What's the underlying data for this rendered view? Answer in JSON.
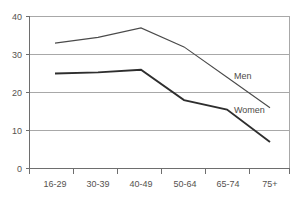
{
  "chart_data": {
    "type": "line",
    "title": "",
    "subtitle": "",
    "xlabel": "",
    "ylabel": "",
    "categories": [
      "16-29",
      "30-39",
      "40-49",
      "50-64",
      "65-74",
      "75+"
    ],
    "series": [
      {
        "name": "Men",
        "values": [
          33,
          34.5,
          37,
          32,
          24,
          16
        ]
      },
      {
        "name": "Women",
        "values": [
          25,
          25.3,
          26,
          18,
          15.5,
          7
        ]
      }
    ],
    "ylim": [
      0,
      40
    ],
    "yticks": [
      0,
      10,
      20,
      30,
      40
    ],
    "ytick_labels": [
      "0",
      "10",
      "20",
      "30",
      "40"
    ],
    "grid": "horizontal",
    "legend": "inline-labels",
    "annotations": [
      {
        "text": "Men",
        "series": "Men",
        "x_category": "65-74",
        "value": 24
      },
      {
        "text": "Women",
        "series": "Women",
        "x_category": "65-74",
        "value": 15.5
      }
    ],
    "colors": {
      "men_line": "#4a4a4a",
      "women_line": "#2e2e2e",
      "gridline": "#a8a8a8",
      "axis": "#6e6e6e",
      "text": "#55524f",
      "background": "#ffffff"
    }
  },
  "axis": {
    "y_labels": [
      "40",
      "30",
      "20",
      "10",
      "0"
    ],
    "x_labels": [
      "16-29",
      "30-39",
      "40-49",
      "50-64",
      "65-74",
      "75+"
    ]
  },
  "labels": {
    "men": "Men",
    "women": "Women"
  }
}
